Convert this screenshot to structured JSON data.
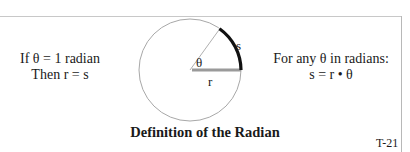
{
  "left_text": {
    "line1": "If θ = 1 radian",
    "line2": "Then r = s"
  },
  "right_text": {
    "line1": "For any θ in radians:",
    "line2": "s = r • θ"
  },
  "diagram": {
    "angle_label": "θ",
    "arc_label": "s",
    "radius_label": "r",
    "circle_color": "#a0a0a0",
    "arc_color": "#111111",
    "radius_color": "#9a9a9a"
  },
  "title": "Definition of the Radian",
  "code": "T-21"
}
